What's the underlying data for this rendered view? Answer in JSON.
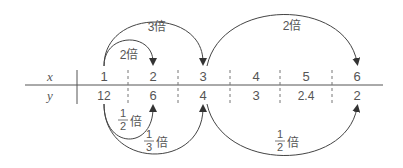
{
  "table": {
    "row_labels": {
      "x": "x",
      "y": "y"
    },
    "x_values": [
      "1",
      "2",
      "3",
      "4",
      "5",
      "6"
    ],
    "y_values": [
      "12",
      "6",
      "4",
      "3",
      "2.4",
      "2"
    ]
  },
  "arrows_top": [
    {
      "from": "1",
      "to": "2",
      "label": "2倍"
    },
    {
      "from": "1",
      "to": "3",
      "label": "3倍"
    },
    {
      "from": "3",
      "to": "6",
      "label": "2倍"
    }
  ],
  "arrows_bottom": [
    {
      "from": "12",
      "to": "6",
      "num": "1",
      "den": "2",
      "suffix": "倍"
    },
    {
      "from": "12",
      "to": "4",
      "num": "1",
      "den": "3",
      "suffix": "倍"
    },
    {
      "from": "4",
      "to": "2",
      "num": "1",
      "den": "2",
      "suffix": "倍"
    }
  ],
  "colors": {
    "line": "#444444",
    "text": "#555555"
  }
}
